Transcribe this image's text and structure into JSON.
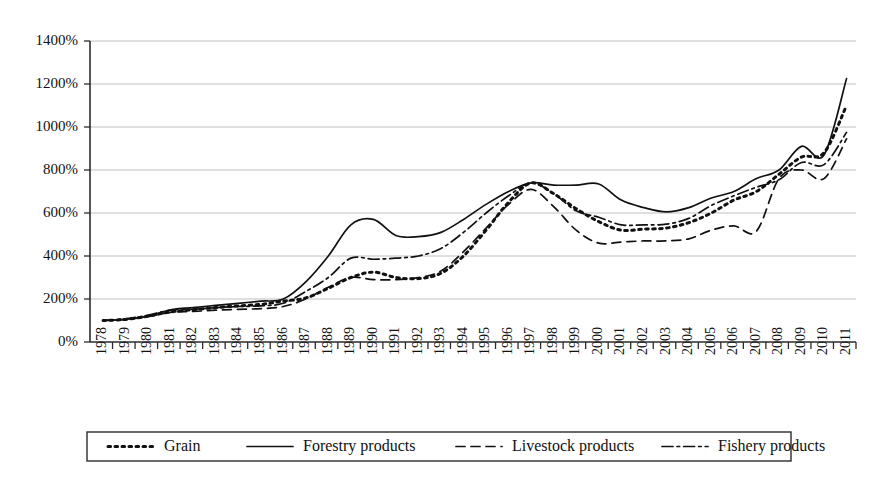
{
  "chart_data": {
    "type": "line",
    "title": "",
    "subtitle": "",
    "xlabel": "",
    "ylabel": "",
    "xlim": [
      1978,
      2012
    ],
    "ylim": [
      0,
      1400
    ],
    "y_unit": "%",
    "grid": true,
    "legend_position": "bottom",
    "x": [
      1978,
      1979,
      1980,
      1981,
      1982,
      1983,
      1984,
      1985,
      1986,
      1987,
      1988,
      1989,
      1990,
      1991,
      1992,
      1993,
      1994,
      1995,
      1996,
      1997,
      1998,
      1999,
      2000,
      2001,
      2002,
      2003,
      2004,
      2005,
      2006,
      2007,
      2008,
      2009,
      2010,
      2011
    ],
    "categories": [
      "1978",
      "1979",
      "1980",
      "1981",
      "1982",
      "1983",
      "1984",
      "1985",
      "1986",
      "1987",
      "1988",
      "1989",
      "1990",
      "1991",
      "1992",
      "1993",
      "1994",
      "1995",
      "1996",
      "1997",
      "1998",
      "1999",
      "2000",
      "2001",
      "2002",
      "2003",
      "2004",
      "2005",
      "2006",
      "2007",
      "2008",
      "2009",
      "2010",
      "2011"
    ],
    "ytick_labels": [
      "0%",
      "200%",
      "400%",
      "600%",
      "800%",
      "1000%",
      "1200%",
      "1400%"
    ],
    "yticks": [
      0,
      200,
      400,
      600,
      800,
      1000,
      1200,
      1400
    ],
    "series": [
      {
        "name": "Grain",
        "style": "dotted",
        "color": "#111111",
        "values": [
          100,
          105,
          120,
          140,
          150,
          160,
          168,
          175,
          190,
          205,
          250,
          300,
          325,
          300,
          295,
          320,
          400,
          520,
          650,
          740,
          690,
          620,
          560,
          520,
          525,
          530,
          555,
          600,
          660,
          700,
          780,
          860,
          880,
          1100
        ]
      },
      {
        "name": "Forestry products",
        "style": "solid",
        "color": "#111111",
        "values": [
          100,
          105,
          120,
          150,
          160,
          170,
          180,
          190,
          200,
          280,
          400,
          545,
          570,
          495,
          490,
          510,
          570,
          640,
          700,
          740,
          730,
          730,
          735,
          660,
          625,
          605,
          625,
          670,
          700,
          760,
          800,
          910,
          870,
          1225
        ]
      },
      {
        "name": "Livestock products",
        "style": "dashed",
        "color": "#111111",
        "values": [
          100,
          105,
          118,
          138,
          142,
          148,
          152,
          155,
          165,
          200,
          255,
          300,
          290,
          290,
          300,
          330,
          420,
          530,
          640,
          710,
          630,
          520,
          460,
          465,
          470,
          470,
          480,
          520,
          540,
          515,
          760,
          800,
          760,
          945
        ]
      },
      {
        "name": "Fishery products",
        "style": "dashdot",
        "color": "#111111",
        "values": [
          100,
          108,
          125,
          148,
          152,
          160,
          165,
          168,
          180,
          235,
          300,
          390,
          385,
          390,
          400,
          435,
          510,
          600,
          680,
          740,
          690,
          610,
          580,
          545,
          545,
          548,
          575,
          635,
          680,
          720,
          755,
          835,
          825,
          975
        ]
      }
    ]
  },
  "axis": {
    "y_axis_name": "percent-axis",
    "x_axis_name": "year-axis"
  },
  "legend": {
    "items": [
      {
        "label": "Grain",
        "style": "dotted"
      },
      {
        "label": "Forestry products",
        "style": "solid"
      },
      {
        "label": "Livestock products",
        "style": "dashed"
      },
      {
        "label": "Fishery products",
        "style": "dashdot"
      }
    ]
  }
}
